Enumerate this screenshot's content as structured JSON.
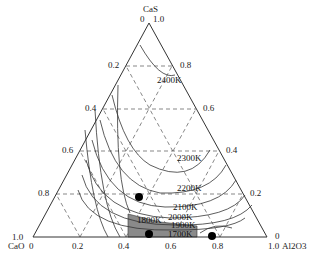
{
  "vertices": {
    "top": "CaS",
    "left": "CaO",
    "right": "Al2O3"
  },
  "vertex_labels": {
    "top_left_value": "0",
    "top_right_value": "1.0",
    "left_value": "1.0",
    "left_bottom_value": "0",
    "right_value": "0",
    "right_bottom_value": "1.0"
  },
  "left_axis_ticks": [
    "0.2",
    "0.4",
    "0.6",
    "0.8"
  ],
  "right_axis_ticks": [
    "0.8",
    "0.6",
    "0.4",
    "0.2"
  ],
  "bottom_axis_ticks": [
    "0.2",
    "0.4",
    "0.6",
    "0.8"
  ],
  "isotherms": [
    "2400K",
    "2300K",
    "2200K",
    "2100K",
    "2000K",
    "1900K",
    "1800K",
    "1700K"
  ],
  "points": [
    {
      "x": 0.45,
      "y_label": "near 0.8 CaO line"
    },
    {
      "x": 0.5,
      "y_label": "bottom"
    },
    {
      "x": 0.75,
      "y_label": "bottom"
    }
  ],
  "colors": {
    "line": "#333333",
    "shade": "#8a8a8a",
    "point": "#000000"
  }
}
